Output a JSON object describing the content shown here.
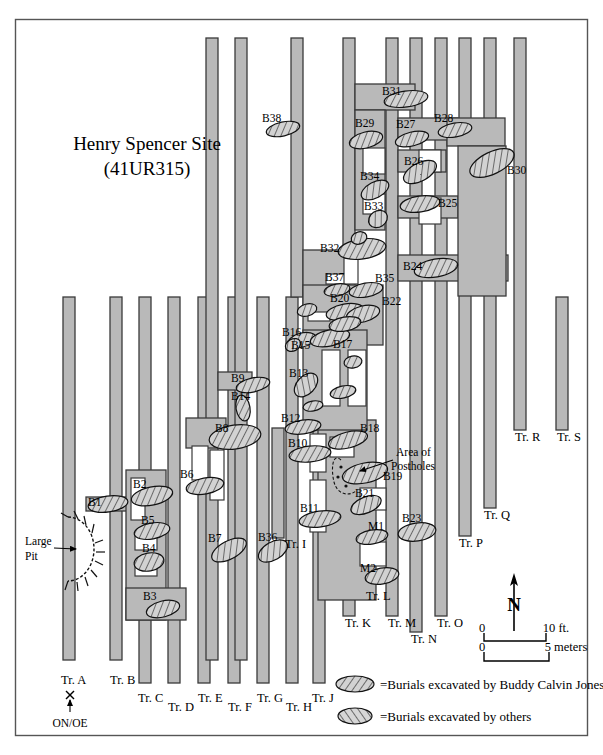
{
  "title": {
    "line1": "Henry Spencer Site",
    "line2": "(41UR315)"
  },
  "annotations": {
    "large_pit_line1": "Large",
    "large_pit_line2": "Pit",
    "postholes_line1": "Area of",
    "postholes_line2": "Postholes",
    "datum": "ON/OE"
  },
  "north_arrow": {
    "label": "N"
  },
  "scale_bars": [
    {
      "zero": "0",
      "value": "10 ft."
    },
    {
      "zero": "0",
      "value": "5 meters"
    }
  ],
  "legend": [
    {
      "swatch": "burials-jones-swatch",
      "text": "=Burials excavated by Buddy Calvin Jones"
    },
    {
      "swatch": "burials-others-swatch",
      "text": "=Burials excavated by others"
    }
  ],
  "colors": {
    "trench_fill": "#b9b9b9",
    "trench_stroke": "#3a3a3a",
    "burial_fill": "#cfcfcf",
    "burial_stroke": "#111111",
    "frame": "#555555",
    "paper": "#ffffff"
  },
  "trench_labels": [
    {
      "id": "A",
      "text": "Tr. A",
      "x": 61,
      "y": 684
    },
    {
      "id": "B",
      "text": "Tr. B",
      "x": 110,
      "y": 684
    },
    {
      "id": "C",
      "text": "Tr. C",
      "x": 138,
      "y": 702
    },
    {
      "id": "D",
      "text": "Tr. D",
      "x": 168,
      "y": 711
    },
    {
      "id": "E",
      "text": "Tr. E",
      "x": 198,
      "y": 702
    },
    {
      "id": "F",
      "text": "Tr. F",
      "x": 228,
      "y": 711
    },
    {
      "id": "G",
      "text": "Tr. G",
      "x": 257,
      "y": 702
    },
    {
      "id": "H",
      "text": "Tr. H",
      "x": 286,
      "y": 711
    },
    {
      "id": "I",
      "text": "Tr. I",
      "x": 285,
      "y": 548
    },
    {
      "id": "J",
      "text": "Tr. J",
      "x": 312,
      "y": 702
    },
    {
      "id": "K",
      "text": "Tr. K",
      "x": 345,
      "y": 627
    },
    {
      "id": "L",
      "text": "Tr. L",
      "x": 366,
      "y": 600
    },
    {
      "id": "M",
      "text": "Tr. M",
      "x": 388,
      "y": 627
    },
    {
      "id": "N",
      "text": "Tr. N",
      "x": 411,
      "y": 643
    },
    {
      "id": "O",
      "text": "Tr. O",
      "x": 437,
      "y": 627
    },
    {
      "id": "P",
      "text": "Tr. P",
      "x": 459,
      "y": 547
    },
    {
      "id": "Q",
      "text": "Tr. Q",
      "x": 484,
      "y": 519
    },
    {
      "id": "R",
      "text": "Tr. R",
      "x": 515,
      "y": 441
    },
    {
      "id": "S",
      "text": "Tr. S",
      "x": 557,
      "y": 441
    }
  ],
  "burial_labels": [
    {
      "id": "B1",
      "text": "B1",
      "x": 88,
      "y": 506
    },
    {
      "id": "B2",
      "text": "B2",
      "x": 133,
      "y": 488
    },
    {
      "id": "B3",
      "text": "B3",
      "x": 143,
      "y": 600
    },
    {
      "id": "B4",
      "text": "B4",
      "x": 142,
      "y": 552
    },
    {
      "id": "B5",
      "text": "B5",
      "x": 141,
      "y": 524
    },
    {
      "id": "B6",
      "text": "B6",
      "x": 180,
      "y": 478
    },
    {
      "id": "B7",
      "text": "B7",
      "x": 208,
      "y": 542
    },
    {
      "id": "B8",
      "text": "B8",
      "x": 215,
      "y": 432
    },
    {
      "id": "B9",
      "text": "B9",
      "x": 231,
      "y": 382
    },
    {
      "id": "B10",
      "text": "B10",
      "x": 288,
      "y": 447
    },
    {
      "id": "B11",
      "text": "B11",
      "x": 300,
      "y": 512
    },
    {
      "id": "B12",
      "text": "B12",
      "x": 281,
      "y": 422
    },
    {
      "id": "B13",
      "text": "B13",
      "x": 289,
      "y": 377
    },
    {
      "id": "B14",
      "text": "B14",
      "x": 231,
      "y": 400
    },
    {
      "id": "B15",
      "text": "B15",
      "x": 291,
      "y": 349
    },
    {
      "id": "B16",
      "text": "B16",
      "x": 282,
      "y": 336
    },
    {
      "id": "B17",
      "text": "B17",
      "x": 333,
      "y": 348
    },
    {
      "id": "B18",
      "text": "B18",
      "x": 360,
      "y": 432
    },
    {
      "id": "B19",
      "text": "B19",
      "x": 383,
      "y": 480
    },
    {
      "id": "B20",
      "text": "B20",
      "x": 330,
      "y": 302
    },
    {
      "id": "B21",
      "text": "B21",
      "x": 355,
      "y": 497
    },
    {
      "id": "B22",
      "text": "B22",
      "x": 382,
      "y": 305
    },
    {
      "id": "B23",
      "text": "B23",
      "x": 402,
      "y": 522
    },
    {
      "id": "B24",
      "text": "B24",
      "x": 403,
      "y": 270
    },
    {
      "id": "B25",
      "text": "B25",
      "x": 438,
      "y": 207
    },
    {
      "id": "B26",
      "text": "B26",
      "x": 404,
      "y": 165
    },
    {
      "id": "B27",
      "text": "B27",
      "x": 396,
      "y": 128
    },
    {
      "id": "B28",
      "text": "B28",
      "x": 434,
      "y": 122
    },
    {
      "id": "B29",
      "text": "B29",
      "x": 355,
      "y": 127
    },
    {
      "id": "B30",
      "text": "B30",
      "x": 507,
      "y": 174
    },
    {
      "id": "B31",
      "text": "B31",
      "x": 382,
      "y": 95
    },
    {
      "id": "B32",
      "text": "B32",
      "x": 320,
      "y": 252
    },
    {
      "id": "B33",
      "text": "B33",
      "x": 364,
      "y": 210
    },
    {
      "id": "B34",
      "text": "B34",
      "x": 360,
      "y": 180
    },
    {
      "id": "B35",
      "text": "B35",
      "x": 375,
      "y": 282
    },
    {
      "id": "B36",
      "text": "B36",
      "x": 258,
      "y": 541
    },
    {
      "id": "B37",
      "text": "B37",
      "x": 325,
      "y": 281
    },
    {
      "id": "B38",
      "text": "B38",
      "x": 262,
      "y": 122
    },
    {
      "id": "M1",
      "text": "M1",
      "x": 368,
      "y": 530
    },
    {
      "id": "M2",
      "text": "M2",
      "x": 360,
      "y": 572
    }
  ],
  "trenches": [
    {
      "id": "A",
      "x": 63,
      "y": 297,
      "w": 12,
      "h": 363
    },
    {
      "id": "B",
      "x": 110,
      "y": 297,
      "w": 12,
      "h": 363
    },
    {
      "id": "C",
      "x": 139,
      "y": 297,
      "w": 12,
      "h": 386
    },
    {
      "id": "D",
      "x": 168,
      "y": 297,
      "w": 12,
      "h": 386
    },
    {
      "id": "E",
      "x": 198,
      "y": 297,
      "w": 12,
      "h": 386
    },
    {
      "id": "F",
      "x": 228,
      "y": 297,
      "w": 12,
      "h": 386
    },
    {
      "id": "G",
      "x": 257,
      "y": 297,
      "w": 12,
      "h": 386
    },
    {
      "id": "H",
      "x": 286,
      "y": 297,
      "w": 12,
      "h": 386
    },
    {
      "id": "J",
      "x": 313,
      "y": 297,
      "w": 12,
      "h": 386
    },
    {
      "id": "I",
      "x": 272,
      "y": 428,
      "w": 12,
      "h": 110
    },
    {
      "id": "K",
      "x": 343,
      "y": 38,
      "w": 12,
      "h": 578
    },
    {
      "id": "M",
      "x": 386,
      "y": 38,
      "w": 12,
      "h": 578
    },
    {
      "id": "N",
      "x": 410,
      "y": 38,
      "w": 12,
      "h": 594
    },
    {
      "id": "O",
      "x": 435,
      "y": 38,
      "w": 12,
      "h": 578
    },
    {
      "id": "P",
      "x": 459,
      "y": 38,
      "w": 12,
      "h": 498
    },
    {
      "id": "Q",
      "x": 484,
      "y": 38,
      "w": 12,
      "h": 470
    },
    {
      "id": "R",
      "x": 514,
      "y": 38,
      "w": 12,
      "h": 392
    },
    {
      "id": "S",
      "x": 556,
      "y": 297,
      "w": 12,
      "h": 133
    },
    {
      "id": "T1",
      "x": 206,
      "y": 38,
      "w": 12,
      "h": 622
    },
    {
      "id": "T2",
      "x": 235,
      "y": 38,
      "w": 12,
      "h": 622
    },
    {
      "id": "T3",
      "x": 291,
      "y": 38,
      "w": 12,
      "h": 259
    }
  ]
}
